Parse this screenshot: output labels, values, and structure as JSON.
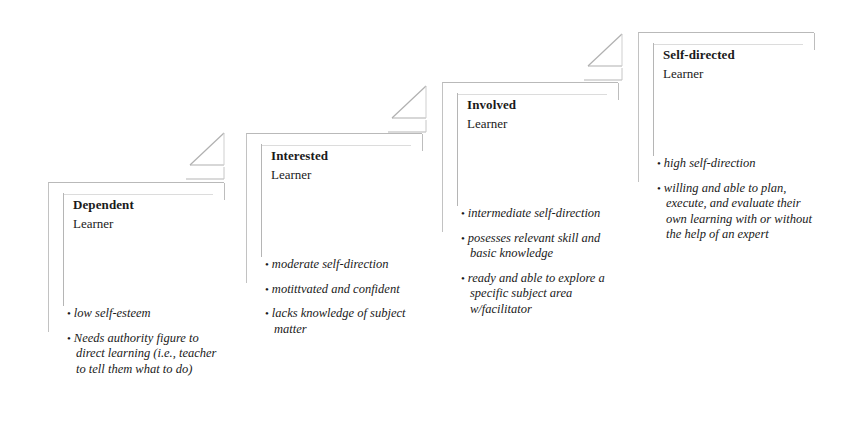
{
  "diagram": {
    "background_color": "#ffffff",
    "line_color": "#b9b9b9",
    "text_color": "#1a1a1a",
    "bullet_glyph": "•",
    "stages": [
      {
        "id": "dependent",
        "title": "Dependent",
        "subtitle": "Learner",
        "bullets": [
          "low self-esteem",
          "Needs authority figure to direct learning (i.e., teacher to tell them what to do)"
        ]
      },
      {
        "id": "interested",
        "title": "Interested",
        "subtitle": "Learner",
        "bullets": [
          "moderate self-direction",
          "motittvated and confident",
          "lacks knowledge of subject matter"
        ]
      },
      {
        "id": "involved",
        "title": "Involved",
        "subtitle": "Learner",
        "bullets": [
          "intermediate self-direction",
          "posesses relevant skill and basic knowledge",
          "ready and able to explore a specific subject area w/facilitator"
        ]
      },
      {
        "id": "self-directed",
        "title": "Self-directed",
        "subtitle": "Learner",
        "bullets": [
          "high self-direction",
          "willing and able to plan, execute, and evaluate their own learning with or without the help of an expert"
        ]
      }
    ],
    "risers": [
      {
        "id": "riser-1",
        "label": "step-up-arrow"
      },
      {
        "id": "riser-2",
        "label": "step-up-arrow"
      },
      {
        "id": "riser-3",
        "label": "step-up-arrow"
      }
    ]
  }
}
